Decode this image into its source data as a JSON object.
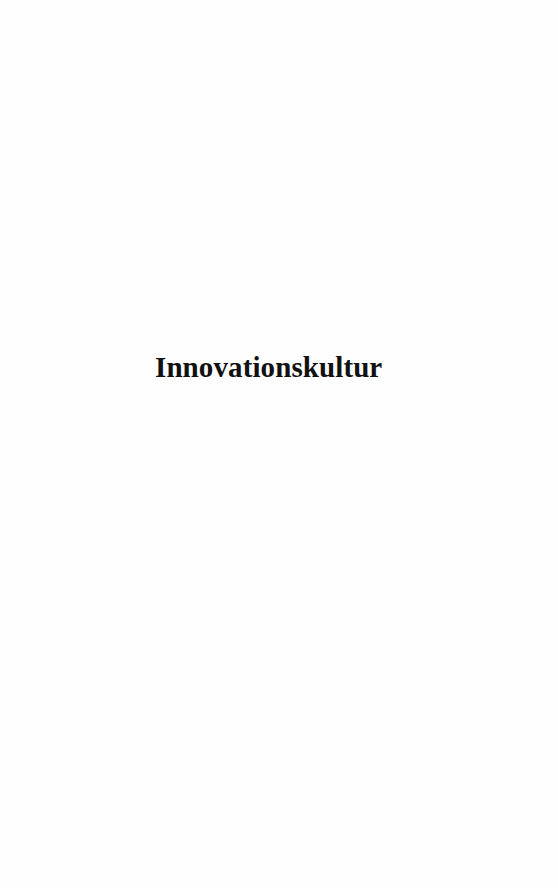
{
  "page": {
    "type": "half-title",
    "title": "Innovationskultur",
    "colors": {
      "background": "#fefefe",
      "text": "#111111"
    }
  }
}
